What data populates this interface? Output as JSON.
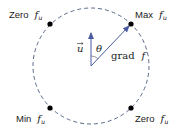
{
  "diagram": {
    "circle": {
      "cx": 91,
      "cy": 66,
      "r": 58,
      "stroke": "#5a6a8a",
      "dashed": true
    },
    "vectors": {
      "u": {
        "label": "u",
        "from": [
          91,
          66
        ],
        "to": [
          91,
          32
        ],
        "color": "#4a5aa0"
      },
      "grad_f": {
        "label_text": "grad",
        "label_var": "f",
        "from": [
          91,
          66
        ],
        "to": [
          131,
          24
        ],
        "color": "#4a5aa0"
      }
    },
    "angle": {
      "label": "θ"
    },
    "points": [
      {
        "id": "zero-top-left",
        "prefix": "Zero",
        "var": "f",
        "sub": "u",
        "x": 50,
        "y": 24
      },
      {
        "id": "max",
        "prefix": "Max",
        "var": "f",
        "sub": "u",
        "x": 131,
        "y": 24
      },
      {
        "id": "min",
        "prefix": "Min",
        "var": "f",
        "sub": "u",
        "x": 50,
        "y": 108
      },
      {
        "id": "zero-bottom-right",
        "prefix": "Zero",
        "var": "f",
        "sub": "u",
        "x": 131,
        "y": 108
      }
    ]
  }
}
